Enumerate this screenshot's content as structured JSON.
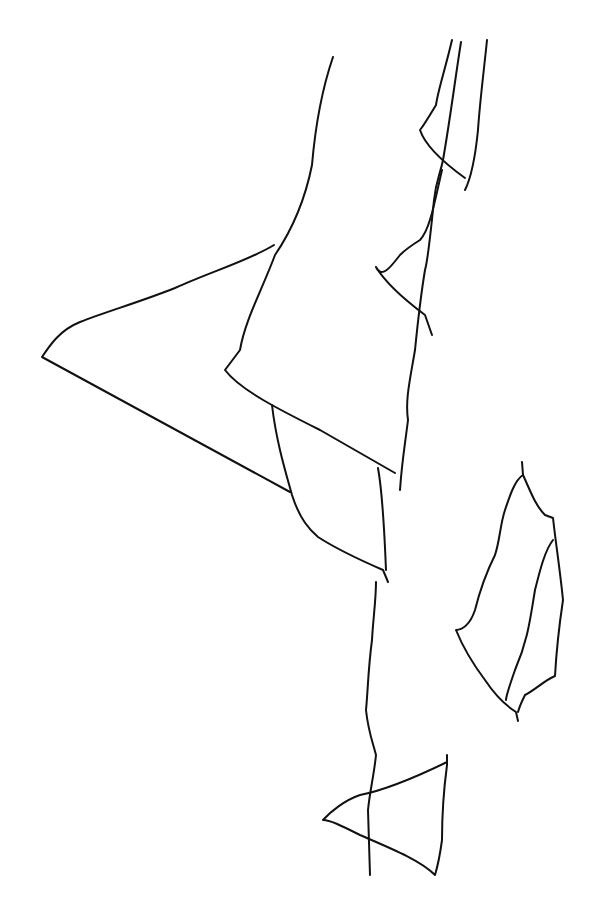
{
  "drawing": {
    "description": "Black line-art sketch of overlapping angular shapes (triangles and irregular polygons) on white background",
    "stroke_color": "#111111",
    "background_color": "#ffffff",
    "shapes": [
      "large-left-triangle",
      "tall-band",
      "upper-right-sliver",
      "small-mid-triangle",
      "middle-quad",
      "right-leaf-shape",
      "bottom-triangle",
      "long-wavy-line"
    ]
  }
}
